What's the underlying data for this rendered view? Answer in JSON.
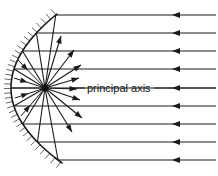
{
  "figure": {
    "type": "optics-ray-diagram",
    "width": 218,
    "height": 176,
    "background_color": "#ffffff",
    "line_color": "#1a1a1a",
    "hatch_color": "#555555"
  },
  "labels": {
    "principal_axis": "principal axis"
  },
  "mirror": {
    "name": "concave-mirror",
    "vertex": {
      "x": 11,
      "y": 88
    },
    "top_end": {
      "x": 57,
      "y": 14
    },
    "bottom_end": {
      "x": 62,
      "y": 163
    },
    "hatch_count": 34,
    "hatch_length": 7,
    "stroke_width": 1.6
  },
  "focal_point": {
    "name": "focal-point",
    "x": 45,
    "y": 88,
    "radius": 3.4
  },
  "chart_data": {
    "type": "scatter",
    "xlabel": "",
    "ylabel": "",
    "annotations": [
      "principal axis"
    ],
    "incoming_rays_y": [
      15,
      33,
      51,
      69,
      88,
      106,
      124,
      142,
      160
    ],
    "incoming_ray_start_x": 216,
    "arrowhead_x": 172,
    "focal_point": [
      45,
      88
    ],
    "mirror_vertex": [
      11,
      88
    ]
  },
  "rays": {
    "incoming": [
      {
        "name": "incoming-ray-1",
        "y": 15,
        "x_start": 216,
        "x_end": 57,
        "arrow_x": 172
      },
      {
        "name": "incoming-ray-2",
        "y": 33,
        "x_start": 216,
        "x_end": 38,
        "arrow_x": 172
      },
      {
        "name": "incoming-ray-3",
        "y": 51,
        "x_start": 216,
        "x_end": 26,
        "arrow_x": 172
      },
      {
        "name": "incoming-ray-4",
        "y": 69,
        "x_start": 216,
        "x_end": 16,
        "arrow_x": 172
      },
      {
        "name": "incoming-ray-5",
        "y": 88,
        "x_start": 216,
        "x_end": 11,
        "arrow_x": 172
      },
      {
        "name": "incoming-ray-6",
        "y": 106,
        "x_start": 216,
        "x_end": 16,
        "arrow_x": 172
      },
      {
        "name": "incoming-ray-7",
        "y": 124,
        "x_start": 216,
        "x_end": 27,
        "arrow_x": 172
      },
      {
        "name": "incoming-ray-8",
        "y": 142,
        "x_start": 216,
        "x_end": 41,
        "arrow_x": 172
      },
      {
        "name": "incoming-ray-9",
        "y": 160,
        "x_start": 216,
        "x_end": 60,
        "arrow_x": 172
      }
    ],
    "reflected": [
      {
        "name": "reflected-ray-1",
        "x1": 57,
        "y1": 15,
        "x2": 45,
        "y2": 88
      },
      {
        "name": "reflected-ray-2",
        "x1": 38,
        "y1": 33,
        "x2": 45,
        "y2": 88
      },
      {
        "name": "reflected-ray-3",
        "x1": 26,
        "y1": 51,
        "x2": 45,
        "y2": 88
      },
      {
        "name": "reflected-ray-4",
        "x1": 16,
        "y1": 69,
        "x2": 45,
        "y2": 88
      },
      {
        "name": "reflected-ray-5",
        "x1": 11,
        "y1": 88,
        "x2": 45,
        "y2": 88
      },
      {
        "name": "reflected-ray-6",
        "x1": 16,
        "y1": 106,
        "x2": 45,
        "y2": 88
      },
      {
        "name": "reflected-ray-7",
        "x1": 27,
        "y1": 124,
        "x2": 45,
        "y2": 88
      },
      {
        "name": "reflected-ray-8",
        "x1": 41,
        "y1": 142,
        "x2": 45,
        "y2": 88
      },
      {
        "name": "reflected-ray-9",
        "x1": 60,
        "y1": 160,
        "x2": 45,
        "y2": 88
      }
    ],
    "diverging": [
      {
        "name": "diverging-ray-1",
        "x1": 45,
        "y1": 88,
        "x2": 72,
        "y2": 132
      },
      {
        "name": "diverging-ray-2",
        "x1": 45,
        "y1": 88,
        "x2": 82,
        "y2": 118
      },
      {
        "name": "diverging-ray-3",
        "x1": 45,
        "y1": 88,
        "x2": 80,
        "y2": 100
      },
      {
        "name": "diverging-ray-4",
        "x1": 45,
        "y1": 88,
        "x2": 77,
        "y2": 89
      },
      {
        "name": "diverging-ray-5",
        "x1": 45,
        "y1": 88,
        "x2": 79,
        "y2": 78
      },
      {
        "name": "diverging-ray-6",
        "x1": 45,
        "y1": 88,
        "x2": 81,
        "y2": 65
      },
      {
        "name": "diverging-ray-7",
        "x1": 45,
        "y1": 88,
        "x2": 74,
        "y2": 50
      },
      {
        "name": "diverging-ray-8",
        "x1": 45,
        "y1": 88,
        "x2": 61,
        "y2": 36
      }
    ],
    "converging_inward": [
      {
        "name": "converging-mark-1",
        "x1": 18,
        "y1": 60,
        "x2": 45,
        "y2": 88
      },
      {
        "name": "converging-mark-2",
        "x1": 14,
        "y1": 78,
        "x2": 45,
        "y2": 88
      },
      {
        "name": "converging-mark-3",
        "x1": 15,
        "y1": 98,
        "x2": 45,
        "y2": 88
      },
      {
        "name": "converging-mark-4",
        "x1": 21,
        "y1": 116,
        "x2": 45,
        "y2": 88
      }
    ]
  },
  "axis_label_line": {
    "name": "principal-axis-callout",
    "left_segment": {
      "x1": 73,
      "x2": 85,
      "y": 88
    },
    "right_segment": {
      "x1": 154,
      "x2": 216,
      "y": 88
    },
    "text_x": 87,
    "text_y": 89
  }
}
